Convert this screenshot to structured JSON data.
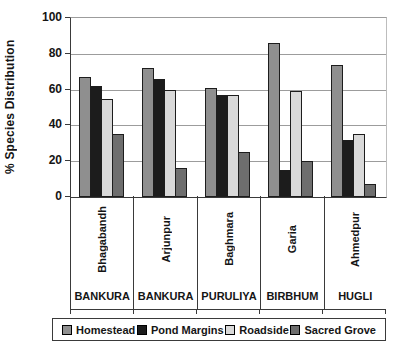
{
  "chart_data": {
    "type": "bar",
    "title": "",
    "ylabel": "% Species Distribution",
    "xlabel": "",
    "ylim": [
      0,
      100
    ],
    "yticks": [
      0,
      20,
      40,
      60,
      80,
      100
    ],
    "grid": "horizontal",
    "legend_position": "bottom",
    "categories": [
      {
        "village": "Bhagabandh",
        "district": "BANKURA"
      },
      {
        "village": "Arjunpur",
        "district": "BANKURA"
      },
      {
        "village": "Baghmara",
        "district": "PURULIYA"
      },
      {
        "village": "Garia",
        "district": "BIRBHUM"
      },
      {
        "village": "Ahmedpur",
        "district": "HUGLI"
      }
    ],
    "series": [
      {
        "name": "Homestead",
        "color": "#8f8f8f",
        "values": [
          67,
          72,
          61,
          86,
          74
        ]
      },
      {
        "name": "Pond Margins",
        "color": "#1c1c1c",
        "values": [
          62,
          66,
          57,
          15,
          32
        ]
      },
      {
        "name": "Roadside",
        "color": "#d9d9d9",
        "values": [
          55,
          60,
          57,
          59,
          35
        ]
      },
      {
        "name": "Sacred Grove",
        "color": "#6e6e6e",
        "values": [
          35,
          16,
          25,
          20,
          7
        ]
      }
    ],
    "colors": {
      "axis_line": "#3a3a3a",
      "gridline": "#9c9c9c",
      "bar_border": "#1d1d1d",
      "text": "#151515",
      "background": "#ffffff"
    }
  }
}
